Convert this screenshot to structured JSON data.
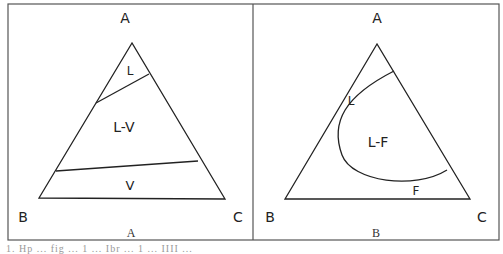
{
  "figure": {
    "panels": [
      {
        "caption": "A",
        "vertices": {
          "top": "A",
          "bottom_left": "B",
          "bottom_right": "C"
        },
        "regions": [
          "L",
          "L-V",
          "V"
        ]
      },
      {
        "caption": "B",
        "vertices": {
          "top": "A",
          "bottom_left": "B",
          "bottom_right": "C"
        },
        "regions": [
          "L",
          "L-F",
          "F"
        ]
      }
    ],
    "footer_text": "1. Hp ... fig ... 1 ... Ibr ... 1 ... IIII ..."
  },
  "colors": {
    "line": "#222222",
    "frame": "#555555",
    "background": "#ffffff"
  }
}
